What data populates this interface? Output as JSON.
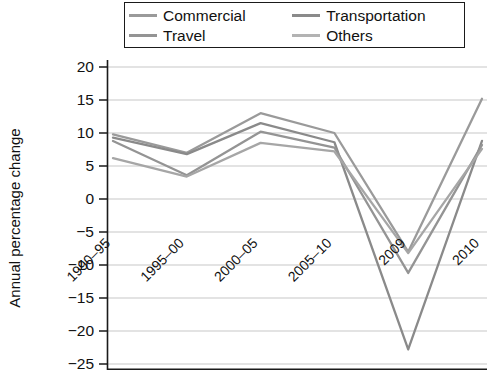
{
  "chart_data": {
    "type": "line",
    "title": "",
    "xlabel": "",
    "ylabel": "Annual percentage change",
    "categories": [
      "1990–95",
      "1995–00",
      "2000–05",
      "2005–10",
      "2009",
      "2010"
    ],
    "ylim": [
      -25,
      20
    ],
    "yticks": [
      20,
      15,
      10,
      5,
      0,
      -5,
      -10,
      -15,
      -20,
      -25
    ],
    "ytick_labels": [
      "20",
      "15",
      "10",
      "5",
      "0",
      "−5",
      "−10",
      "−15",
      "−20",
      "−25"
    ],
    "grid": true,
    "legend_position": "top",
    "series": [
      {
        "name": "Commercial",
        "color": "#9a9a9a",
        "values": [
          9.8,
          7.0,
          13.0,
          10.0,
          -8.0,
          15.2
        ]
      },
      {
        "name": "Transportation",
        "color": "#8a8a8a",
        "values": [
          9.3,
          6.8,
          11.5,
          8.6,
          -22.8,
          8.8
        ]
      },
      {
        "name": "Travel",
        "color": "#949494",
        "values": [
          8.8,
          3.6,
          10.2,
          7.8,
          -11.2,
          8.2
        ]
      },
      {
        "name": "Others",
        "color": "#a6a6a6",
        "values": [
          6.2,
          3.4,
          8.5,
          7.2,
          -8.2,
          7.6
        ]
      }
    ]
  },
  "legend": {
    "entries": [
      {
        "label": "Commercial"
      },
      {
        "label": "Transportation"
      },
      {
        "label": "Travel"
      },
      {
        "label": "Others"
      }
    ]
  },
  "axes": {
    "y_title": "Annual percentage change"
  }
}
